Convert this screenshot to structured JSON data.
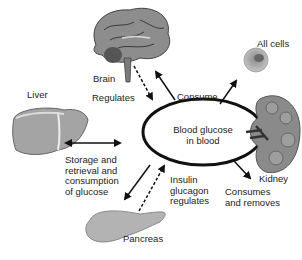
{
  "diagram": {
    "center": {
      "line1": "Blood glucose",
      "line2": "in blood"
    },
    "organs": {
      "brain": {
        "label": "Brain"
      },
      "liver": {
        "label": "Liver"
      },
      "all_cells": {
        "label": "All cells"
      },
      "kidney": {
        "label": "Kidney"
      },
      "pancreas": {
        "label": "Pancreas"
      }
    },
    "relations": {
      "brain_regulates": "Regulates",
      "brain_consume": "Consume",
      "liver_storage": [
        "Storage and",
        "retrieval and",
        "consumption",
        "of glucose"
      ],
      "pancreas_regulates": [
        "Insulin",
        "glucagon",
        "regulates"
      ],
      "kidney_consumes": [
        "Consumes",
        "and removes"
      ]
    },
    "colors": {
      "ellipse": "#111111",
      "arrow": "#111111",
      "organ_fill": "#9a9a9a",
      "organ_dark": "#5a5a5a"
    }
  }
}
